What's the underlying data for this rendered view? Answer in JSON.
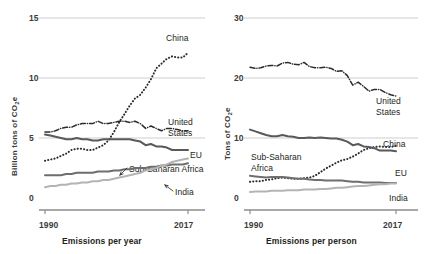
{
  "figure": {
    "background": "#ffffff",
    "ink": "#231f20"
  },
  "colors": {
    "china": "#2c2c2c",
    "united_states": "#2c2c2c",
    "eu": "#595959",
    "sub_saharan_africa": "#6e6e6e",
    "india": "#b4b4b4",
    "gridline": "#c8c8c8",
    "axis": "#8c8c8c"
  },
  "chart_data": [
    {
      "type": "line",
      "panel": "left",
      "title": "",
      "xlabel": "Emissions per year",
      "ylabel": "Billion tons of CO₂e",
      "ylabel_text": "Billion tons of CO",
      "ylabel_sub": "2",
      "ylabel_tail": "e",
      "xlim": [
        1990,
        2017
      ],
      "ylim": [
        0,
        15
      ],
      "yticks": [
        "0",
        "5",
        "10",
        "15"
      ],
      "ytick_values": [
        0,
        5,
        10,
        15
      ],
      "xticks": [
        "1990",
        "2017"
      ],
      "xtick_values": [
        1990,
        2017
      ],
      "grid": "horizontal",
      "legend": "inline-annotations",
      "x": [
        1990,
        1991,
        1992,
        1993,
        1994,
        1995,
        1996,
        1997,
        1998,
        1999,
        2000,
        2001,
        2002,
        2003,
        2004,
        2005,
        2006,
        2007,
        2008,
        2009,
        2010,
        2011,
        2012,
        2013,
        2014,
        2015,
        2016,
        2017
      ],
      "series": [
        {
          "name": "China",
          "style": "dotted",
          "color": "#2c2c2c",
          "label": "China",
          "values": [
            3.1,
            3.2,
            3.3,
            3.5,
            3.7,
            4.0,
            4.1,
            4.1,
            4.0,
            4.0,
            4.2,
            4.4,
            4.8,
            5.5,
            6.3,
            7.0,
            7.7,
            8.3,
            8.6,
            9.2,
            9.9,
            10.8,
            11.2,
            11.6,
            11.8,
            11.7,
            11.7,
            12.1
          ]
        },
        {
          "name": "United States",
          "style": "dash-dot",
          "color": "#2c2c2c",
          "label": "United States",
          "values": [
            5.5,
            5.5,
            5.6,
            5.8,
            5.9,
            5.9,
            6.1,
            6.2,
            6.2,
            6.2,
            6.4,
            6.2,
            6.2,
            6.3,
            6.4,
            6.4,
            6.3,
            6.4,
            6.2,
            5.8,
            6.0,
            5.8,
            5.6,
            5.8,
            5.8,
            5.7,
            5.6,
            5.6
          ]
        },
        {
          "name": "EU",
          "style": "solid",
          "color": "#595959",
          "label": "EU",
          "values": [
            5.3,
            5.2,
            5.1,
            5.0,
            4.9,
            4.9,
            5.0,
            4.9,
            4.9,
            4.8,
            4.8,
            4.9,
            4.9,
            4.9,
            4.9,
            4.9,
            4.9,
            4.8,
            4.7,
            4.4,
            4.5,
            4.3,
            4.3,
            4.2,
            4.0,
            4.0,
            4.0,
            4.0
          ]
        },
        {
          "name": "Sub-Saharan Africa",
          "style": "solid",
          "color": "#6e6e6e",
          "label": "Sub-Saharan Africa",
          "values": [
            1.9,
            1.9,
            1.9,
            1.9,
            2.0,
            2.0,
            2.1,
            2.1,
            2.1,
            2.1,
            2.2,
            2.2,
            2.2,
            2.3,
            2.3,
            2.4,
            2.4,
            2.5,
            2.5,
            2.5,
            2.6,
            2.6,
            2.7,
            2.7,
            2.8,
            2.8,
            2.8,
            2.9
          ]
        },
        {
          "name": "India",
          "style": "solid",
          "color": "#b4b4b4",
          "label": "India",
          "values": [
            0.9,
            1.0,
            1.0,
            1.1,
            1.1,
            1.2,
            1.2,
            1.3,
            1.3,
            1.4,
            1.4,
            1.5,
            1.5,
            1.6,
            1.7,
            1.8,
            1.9,
            2.0,
            2.1,
            2.3,
            2.4,
            2.5,
            2.7,
            2.8,
            3.0,
            3.1,
            3.2,
            3.3
          ]
        }
      ]
    },
    {
      "type": "line",
      "panel": "right",
      "title": "",
      "xlabel": "Emissions per person",
      "ylabel": "Tons of CO₂e",
      "ylabel_text": "Tons of CO",
      "ylabel_sub": "2",
      "ylabel_tail": "e",
      "xlim": [
        1990,
        2017
      ],
      "ylim": [
        0,
        30
      ],
      "yticks": [
        "0",
        "10",
        "20",
        "30"
      ],
      "ytick_values": [
        0,
        10,
        20,
        30
      ],
      "xticks": [
        "1990",
        "2017"
      ],
      "xtick_values": [
        1990,
        2017
      ],
      "grid": "horizontal",
      "legend": "inline-annotations",
      "x": [
        1990,
        1991,
        1992,
        1993,
        1994,
        1995,
        1996,
        1997,
        1998,
        1999,
        2000,
        2001,
        2002,
        2003,
        2004,
        2005,
        2006,
        2007,
        2008,
        2009,
        2010,
        2011,
        2012,
        2013,
        2014,
        2015,
        2016,
        2017
      ],
      "series": [
        {
          "name": "United States",
          "style": "dash-dot",
          "color": "#2c2c2c",
          "label": "United States",
          "values": [
            21.8,
            21.6,
            21.7,
            22.0,
            22.1,
            22.0,
            22.5,
            22.6,
            22.3,
            22.2,
            22.6,
            21.9,
            21.7,
            21.7,
            21.8,
            21.6,
            21.1,
            21.2,
            20.4,
            18.8,
            19.3,
            18.6,
            17.8,
            18.1,
            18.1,
            17.6,
            17.2,
            17.0
          ]
        },
        {
          "name": "China",
          "style": "dotted",
          "color": "#2c2c2c",
          "label": "China",
          "values": [
            2.7,
            2.8,
            2.8,
            3.0,
            3.1,
            3.3,
            3.4,
            3.3,
            3.2,
            3.2,
            3.3,
            3.4,
            3.7,
            4.3,
            4.9,
            5.4,
            5.9,
            6.3,
            6.5,
            6.9,
            7.4,
            8.0,
            8.3,
            8.5,
            8.6,
            8.5,
            8.5,
            8.7
          ]
        },
        {
          "name": "EU",
          "style": "solid",
          "color": "#595959",
          "label": "EU",
          "values": [
            11.4,
            11.1,
            10.8,
            10.5,
            10.3,
            10.3,
            10.5,
            10.3,
            10.2,
            10.0,
            10.0,
            10.1,
            10.0,
            10.1,
            10.0,
            9.9,
            9.9,
            9.7,
            9.4,
            8.8,
            9.0,
            8.6,
            8.5,
            8.3,
            7.9,
            7.9,
            7.9,
            7.8
          ]
        },
        {
          "name": "Sub-Saharan Africa",
          "style": "solid",
          "color": "#6e6e6e",
          "label": "Sub-Saharan Africa",
          "values": [
            3.7,
            3.6,
            3.5,
            3.4,
            3.5,
            3.5,
            3.5,
            3.4,
            3.3,
            3.2,
            3.2,
            3.1,
            3.0,
            3.0,
            2.9,
            2.9,
            2.9,
            2.9,
            2.8,
            2.7,
            2.7,
            2.6,
            2.6,
            2.6,
            2.6,
            2.5,
            2.5,
            2.5
          ]
        },
        {
          "name": "India",
          "style": "solid",
          "color": "#b4b4b4",
          "label": "India",
          "values": [
            1.0,
            1.1,
            1.1,
            1.1,
            1.2,
            1.2,
            1.2,
            1.3,
            1.3,
            1.3,
            1.4,
            1.4,
            1.4,
            1.5,
            1.5,
            1.6,
            1.7,
            1.7,
            1.8,
            1.9,
            2.0,
            2.0,
            2.1,
            2.2,
            2.3,
            2.3,
            2.4,
            2.4
          ]
        }
      ]
    }
  ]
}
